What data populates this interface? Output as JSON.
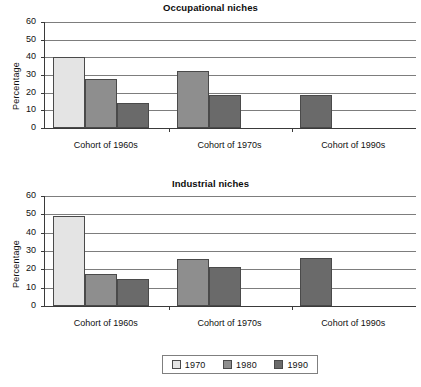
{
  "legend": {
    "entries": [
      {
        "label": "1970",
        "color": "#e4e4e4"
      },
      {
        "label": "1980",
        "color": "#8e8e8e"
      },
      {
        "label": "1990",
        "color": "#6a6a6a"
      }
    ]
  },
  "charts": [
    {
      "id": "occupational",
      "title": "Occupational niches",
      "ylabel": "Percentage"
    },
    {
      "id": "industrial",
      "title": "Industrial niches",
      "ylabel": "Percentage"
    }
  ],
  "chart_data": [
    {
      "type": "bar",
      "title": "Occupational niches",
      "xlabel": "",
      "ylabel": "Percentage",
      "categories": [
        "Cohort of 1960s",
        "Cohort of 1970s",
        "Cohort of 1990s"
      ],
      "series": [
        {
          "name": "1970",
          "color": "#e4e4e4",
          "values": [
            40,
            null,
            null
          ]
        },
        {
          "name": "1980",
          "color": "#8e8e8e",
          "values": [
            27.5,
            32,
            null
          ]
        },
        {
          "name": "1990",
          "color": "#6a6a6a",
          "values": [
            14,
            18.5,
            18.5
          ]
        }
      ],
      "ylim": [
        0,
        60
      ],
      "yticks": [
        0,
        10,
        20,
        30,
        40,
        50,
        60
      ],
      "grid": true,
      "legend_position": "bottom"
    },
    {
      "type": "bar",
      "title": "Industrial niches",
      "xlabel": "",
      "ylabel": "Percentage",
      "categories": [
        "Cohort of 1960s",
        "Cohort of 1970s",
        "Cohort of 1990s"
      ],
      "series": [
        {
          "name": "1970",
          "color": "#e4e4e4",
          "values": [
            49,
            null,
            null
          ]
        },
        {
          "name": "1980",
          "color": "#8e8e8e",
          "values": [
            17.5,
            25.5,
            null
          ]
        },
        {
          "name": "1990",
          "color": "#6a6a6a",
          "values": [
            15,
            21.5,
            26
          ]
        }
      ],
      "ylim": [
        0,
        60
      ],
      "yticks": [
        0,
        10,
        20,
        30,
        40,
        50,
        60
      ],
      "grid": true,
      "legend_position": "bottom"
    }
  ]
}
